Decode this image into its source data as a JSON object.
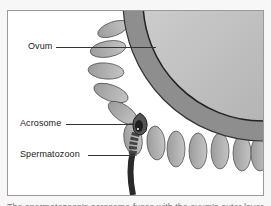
{
  "figure": {
    "labels": [
      {
        "id": "ovum",
        "text": "Ovum"
      },
      {
        "id": "acrosome",
        "text": "Acrosome"
      },
      {
        "id": "spermatozoon",
        "text": "Spermatozoon"
      }
    ],
    "caption": "The spermatozoon's acrosome fuses with the ovum's outer layer"
  },
  "colors": {
    "frame_border": "#9a9a9a",
    "ovum_core": "#c8c8c8",
    "zona": "#8a8a8a",
    "corona": "#a9a9a9",
    "sperm": "#3a3a3a"
  }
}
